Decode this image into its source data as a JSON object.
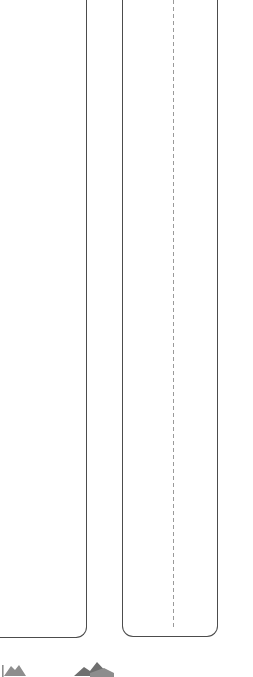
{
  "document": {
    "title": "Panel outlines",
    "background_color": "#ffffff",
    "view": {
      "crop_note": "cropped viewport",
      "width_px": 253,
      "height_px": 677
    }
  },
  "panels": [
    {
      "id": "panel-left",
      "name": "left-panel",
      "label": "",
      "clipped_edges": [
        "left",
        "top"
      ],
      "visible_edges": [
        "right",
        "bottom"
      ],
      "right_edge_x": 87,
      "bottom_edge_y": 638,
      "corner_radius_px": 11,
      "stroke_color": "#4c4c4c",
      "stroke_width_px": 1.4,
      "fill_color": "#ffffff"
    },
    {
      "id": "panel-right",
      "name": "right-panel",
      "label": "",
      "clipped_edges": [
        "top"
      ],
      "visible_edges": [
        "left",
        "right",
        "bottom"
      ],
      "left_edge_x": 122,
      "right_edge_x": 218,
      "bottom_edge_y": 637,
      "corner_radius_px": 11,
      "stroke_color": "#4c4c4c",
      "stroke_width_px": 1.4,
      "fill_color": "#ffffff"
    }
  ],
  "guides": [
    {
      "id": "fold-line",
      "name": "fold-guide",
      "label": "",
      "orientation": "vertical",
      "style": "dashed",
      "x_px": 173,
      "end_y_px": 629,
      "color": "#9a9a9a",
      "dash_px": 4,
      "gap_px": 3
    }
  ],
  "glyphs": [
    {
      "id": "glyph-a",
      "name": "cropped-glyph-left",
      "label": "",
      "color": "#8d8d8d",
      "clipped": true
    },
    {
      "id": "glyph-b",
      "name": "cropped-glyph-center",
      "label": "",
      "color": "#6f6f6f",
      "clipped": true
    }
  ]
}
